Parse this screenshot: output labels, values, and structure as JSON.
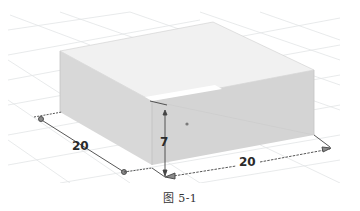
{
  "figure": {
    "caption": "图 5-1",
    "model": "box",
    "background_color": "#ffffff",
    "grid_color": "#e2e4e6",
    "face_colors": {
      "top": "#eeeeee",
      "left": "#d9d9d9",
      "right": "#d3d3d3",
      "inner_highlight": "#ffffff"
    },
    "dimensions": [
      {
        "name": "depth",
        "label": "20"
      },
      {
        "name": "height",
        "label": "7"
      },
      {
        "name": "width",
        "label": "20"
      }
    ]
  }
}
